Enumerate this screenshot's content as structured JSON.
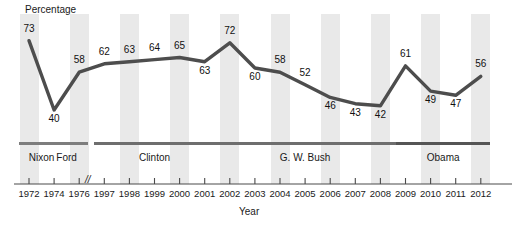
{
  "chart_data": {
    "type": "line",
    "title": "",
    "xlabel": "Year",
    "ylabel": "Percentage",
    "categories": [
      "1972",
      "1974",
      "1976",
      "1997",
      "1998",
      "1999",
      "2000",
      "2001",
      "2002",
      "2003",
      "2004",
      "2005",
      "2006",
      "2007",
      "2008",
      "2009",
      "2010",
      "2011",
      "2012"
    ],
    "values": [
      73,
      40,
      58,
      62,
      63,
      64,
      65,
      63,
      72,
      60,
      58,
      52,
      46,
      43,
      42,
      61,
      49,
      47,
      56
    ],
    "ylim": [
      30,
      80
    ],
    "grid": false,
    "legend": "none",
    "axis_break": {
      "label": "//",
      "between": [
        "1976",
        "1997"
      ]
    },
    "line_color": "#4d4d4d",
    "band_color": "#e9e9e9",
    "annotations": [
      "73",
      "40",
      "58",
      "62",
      "63",
      "64",
      "65",
      "63",
      "72",
      "60",
      "58",
      "52",
      "46",
      "43",
      "42",
      "61",
      "49",
      "47",
      "56"
    ],
    "eras": [
      {
        "label": "Nixon",
        "start": "1972",
        "end": "1974",
        "color": "#7d7d7d"
      },
      {
        "label": "Ford",
        "start": "1974",
        "end": "1976",
        "color": "#7d7d7d"
      },
      {
        "label": "Clinton",
        "start": "1997",
        "end": "2001",
        "color": "#6e6e6e"
      },
      {
        "label": "G. W. Bush",
        "start": "2001",
        "end": "2009",
        "color": "#6e6e6e"
      },
      {
        "label": "Obama",
        "start": "2009",
        "end": "2012",
        "color": "#555555"
      }
    ]
  }
}
